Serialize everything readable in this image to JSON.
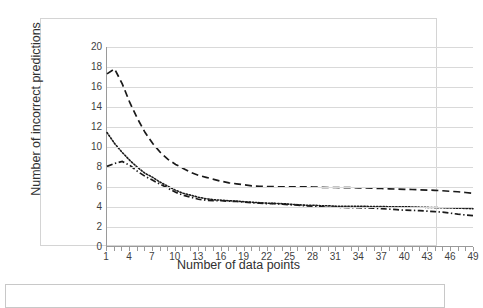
{
  "chart_data": {
    "type": "line",
    "title": "",
    "xlabel": "Number of data points",
    "ylabel": "Number of incorrect predictions",
    "xlim": [
      1,
      49
    ],
    "ylim": [
      0,
      20
    ],
    "grid": "horizontal",
    "legend": "none-visible",
    "y_ticks": [
      20,
      18,
      16,
      14,
      12,
      10,
      8,
      6,
      4,
      2,
      0
    ],
    "x_ticks": [
      1,
      4,
      7,
      10,
      13,
      16,
      19,
      22,
      25,
      28,
      31,
      34,
      37,
      40,
      43,
      46,
      49
    ],
    "x": [
      1,
      2,
      3,
      4,
      5,
      6,
      7,
      8,
      9,
      10,
      11,
      12,
      13,
      14,
      15,
      16,
      17,
      18,
      19,
      20,
      21,
      22,
      23,
      24,
      25,
      26,
      27,
      28,
      29,
      30,
      31,
      32,
      33,
      34,
      35,
      36,
      37,
      38,
      39,
      40,
      41,
      42,
      43,
      44,
      45,
      46,
      47,
      48,
      49
    ],
    "series": [
      {
        "name": "dashed-series",
        "style": "dashed",
        "color": "#1a1a1a",
        "values": [
          17.3,
          17.8,
          16.3,
          14.4,
          12.8,
          11.4,
          10.3,
          9.4,
          8.7,
          8.2,
          7.8,
          7.4,
          7.1,
          6.9,
          6.7,
          6.5,
          6.35,
          6.25,
          6.15,
          6.05,
          6.0,
          5.98,
          5.96,
          5.95,
          5.95,
          5.95,
          5.95,
          5.93,
          5.9,
          5.88,
          5.88,
          5.87,
          5.86,
          5.85,
          5.83,
          5.8,
          5.78,
          5.75,
          5.72,
          5.7,
          5.68,
          5.65,
          5.62,
          5.6,
          5.55,
          5.5,
          5.45,
          5.38,
          5.3
        ]
      },
      {
        "name": "dotted-series",
        "style": "dotted",
        "color": "#1a1a1a",
        "values": [
          11.4,
          10.3,
          9.4,
          8.6,
          7.9,
          7.3,
          6.9,
          6.4,
          6.0,
          5.6,
          5.3,
          5.1,
          4.9,
          4.75,
          4.65,
          4.6,
          4.55,
          4.5,
          4.45,
          4.4,
          4.35,
          4.3,
          4.28,
          4.25,
          4.2,
          4.15,
          4.1,
          4.1,
          4.05,
          4.05,
          4.0,
          4.0,
          4.0,
          3.98,
          3.98,
          3.97,
          3.96,
          3.95,
          3.95,
          3.95,
          3.92,
          3.9,
          3.88,
          3.86,
          3.84,
          3.82,
          3.8,
          3.78,
          3.75
        ]
      },
      {
        "name": "dash-dot-series",
        "style": "dash-dot",
        "color": "#1a1a1a",
        "values": [
          8.0,
          8.3,
          8.5,
          8.1,
          7.5,
          7.0,
          6.6,
          6.2,
          5.8,
          5.4,
          5.1,
          4.9,
          4.7,
          4.6,
          4.55,
          4.55,
          4.5,
          4.48,
          4.4,
          4.35,
          4.3,
          4.25,
          4.25,
          4.2,
          4.15,
          4.1,
          4.05,
          4.0,
          3.95,
          3.9,
          3.9,
          3.88,
          3.86,
          3.85,
          3.83,
          3.8,
          3.75,
          3.7,
          3.65,
          3.6,
          3.58,
          3.55,
          3.5,
          3.45,
          3.4,
          3.3,
          3.2,
          3.12,
          3.05
        ]
      }
    ]
  },
  "axis": {
    "y_title": "Number of incorrect predictions",
    "x_title": "Number of data points"
  },
  "legend": {
    "visible_entries": []
  }
}
